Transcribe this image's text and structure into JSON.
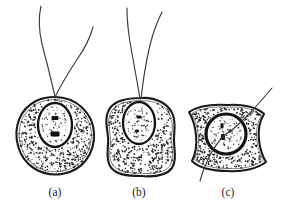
{
  "figure": {
    "kind": "scientific-line-drawing",
    "background_color": "#ffffff",
    "ink_color": "#1a1a1a",
    "stipple_color": "#2b2b2b",
    "panels": [
      {
        "id": "a",
        "label": "(a)",
        "label_x": 55,
        "label_y": 196,
        "cell": {
          "shape": "round",
          "center_x": 55,
          "center_y": 136,
          "radius_x": 38,
          "radius_y": 39,
          "path": "M 55 97 C 76 97 93 113 94 133 C 95 154 82 171 62 174 C 41 177 23 165 18 146 C 13 127 20 109 36 101 C 42 98 48 97 55 97 Z"
        },
        "nucleus": {
          "shape": "oval",
          "center_x": 55,
          "center_y": 125,
          "radius_x": 17,
          "radius_y": 22,
          "style": "thin",
          "chromatin_marks": [
            {
              "x": 55,
              "y": 118,
              "w": 7,
              "h": 4
            },
            {
              "x": 55,
              "y": 134,
              "w": 9,
              "h": 5
            }
          ]
        },
        "flagella": [
          {
            "path": "M 55 97 C 51 78 46 60 42 44 C 39 31 38 19 41 6"
          },
          {
            "path": "M 55 97 C 62 83 70 70 78 58 C 85 48 90 38 93 27"
          }
        ],
        "stipple_seed": 11,
        "stipple_count": 430
      },
      {
        "id": "b",
        "label": "(b)",
        "label_x": 139,
        "label_y": 196,
        "cell": {
          "shape": "lobed-square",
          "center_x": 141,
          "center_y": 137,
          "radius_x": 33,
          "radius_y": 39,
          "path": "M 141 98 C 156 97 169 104 173 115 C 176 124 174 131 174 139 C 174 150 177 160 172 168 C 166 176 152 177 141 176 C 128 176 115 175 110 166 C 105 157 109 147 108 137 C 107 127 104 117 110 108 C 116 100 129 98 141 98 Z"
        },
        "nucleus": {
          "shape": "oval",
          "center_x": 139,
          "center_y": 123,
          "radius_x": 16,
          "radius_y": 21,
          "style": "thin",
          "chromatin_marks": [
            {
              "x": 139,
              "y": 117,
              "w": 5,
              "h": 3
            },
            {
              "x": 137,
              "y": 131,
              "w": 4,
              "h": 3
            }
          ]
        },
        "flagella": [
          {
            "path": "M 140 99 C 137 80 133 60 130 42 C 128 30 127 19 127 8"
          },
          {
            "path": "M 141 99 C 143 80 146 62 150 45 C 153 33 157 22 162 12"
          }
        ],
        "stipple_seed": 23,
        "stipple_count": 400
      },
      {
        "id": "c",
        "label": "(c)",
        "label_x": 228,
        "label_y": 196,
        "cell": {
          "shape": "bilobed-wide",
          "center_x": 228,
          "center_y": 136,
          "radius_x": 38,
          "radius_y": 31,
          "path": "M 228 105 C 243 104 257 107 264 114 C 259 122 258 131 259 140 C 260 150 263 157 266 162 C 257 169 242 172 228 171 C 213 171 199 168 192 161 C 196 153 197 144 196 135 C 195 125 192 117 189 112 C 198 106 213 104 228 105 Z"
        },
        "nucleus": {
          "shape": "circle",
          "center_x": 226,
          "center_y": 134,
          "radius_x": 20,
          "radius_y": 20,
          "style": "thick",
          "chromatin_marks": [
            {
              "x": 222,
              "y": 126,
              "w": 3,
              "h": 5
            },
            {
              "x": 223,
              "y": 137,
              "w": 4,
              "h": 6
            },
            {
              "x": 230,
              "y": 131,
              "w": 3,
              "h": 3
            }
          ]
        },
        "flagella": [
          {
            "path": "M 272 88 C 263 99 253 110 243 120 C 236 127 231 131 226 134 C 221 138 216 145 211 153 C 207 161 203 170 200 181"
          }
        ],
        "stipple_seed": 37,
        "stipple_count": 360
      }
    ]
  }
}
